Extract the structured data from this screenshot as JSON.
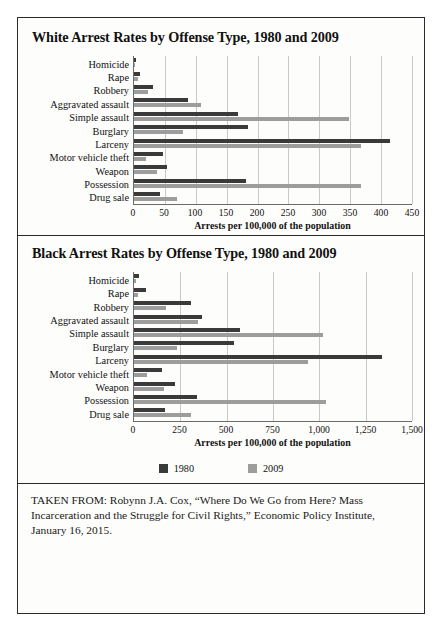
{
  "figure": {
    "legend": [
      {
        "label": "1980",
        "color": "#3a3a3a",
        "swatch": "square-swatch-1980"
      },
      {
        "label": "2009",
        "color": "#9d9d9d",
        "swatch": "square-swatch-2009"
      }
    ],
    "source_note": "TAKEN FROM: Robynn J.A. Cox, “Where Do We Go from Here? Mass Incarceration and the Struggle for Civil Rights,” Economic Policy Institute, January 16, 2015."
  },
  "chart_data": [
    {
      "type": "bar",
      "orientation": "horizontal",
      "title": "White Arrest Rates by Offense Type, 1980 and 2009",
      "xlabel": "Arrests per 100,000 of the population",
      "ylabel": "",
      "xlim": [
        0,
        450
      ],
      "xticks": [
        0,
        50,
        100,
        150,
        200,
        250,
        300,
        350,
        400,
        450
      ],
      "xticklabels": [
        "0",
        "50",
        "100",
        "150",
        "200",
        "250",
        "300",
        "350",
        "400",
        "450"
      ],
      "grid": "vertical",
      "legend_position": "below-figure",
      "categories": [
        "Homicide",
        "Rape",
        "Robbery",
        "Aggravated assault",
        "Simple assault",
        "Burglary",
        "Larceny",
        "Motor vehicle theft",
        "Weapon",
        "Possession",
        "Drug sale"
      ],
      "series": [
        {
          "name": "1980",
          "color": "#3a3a3a",
          "values": [
            4,
            9,
            30,
            88,
            168,
            185,
            415,
            47,
            53,
            182,
            42
          ]
        },
        {
          "name": "2009",
          "color": "#9d9d9d",
          "values": [
            2,
            6,
            22,
            108,
            348,
            80,
            368,
            20,
            38,
            367,
            70
          ]
        }
      ]
    },
    {
      "type": "bar",
      "orientation": "horizontal",
      "title": "Black Arrest Rates by Offense Type, 1980 and 2009",
      "xlabel": "Arrests per 100,000 of the population",
      "ylabel": "",
      "xlim": [
        0,
        1500
      ],
      "xticks": [
        0,
        250,
        500,
        750,
        1000,
        1250,
        1500
      ],
      "xticklabels": [
        "0",
        "250",
        "500",
        "750",
        "1,000",
        "1,250",
        "1,500"
      ],
      "grid": "vertical",
      "legend_position": "below-figure",
      "categories": [
        "Homicide",
        "Rape",
        "Robbery",
        "Aggravated assault",
        "Simple assault",
        "Burglary",
        "Larceny",
        "Motor vehicle theft",
        "Weapon",
        "Possession",
        "Drug sale"
      ],
      "series": [
        {
          "name": "1980",
          "color": "#3a3a3a",
          "values": [
            25,
            65,
            310,
            365,
            570,
            540,
            1340,
            150,
            220,
            340,
            165
          ]
        },
        {
          "name": "2009",
          "color": "#9d9d9d",
          "values": [
            12,
            20,
            175,
            345,
            1020,
            230,
            940,
            70,
            160,
            1035,
            305
          ]
        }
      ]
    }
  ]
}
